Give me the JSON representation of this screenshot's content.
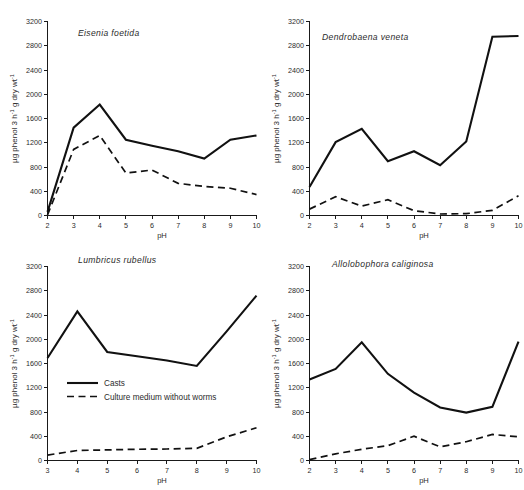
{
  "figure": {
    "name": "phenol-oxidase-activity-vs-ph",
    "axis": {
      "y_label_plain": "µg phenol 3 h-1 g dry wt-1",
      "y_label_parts": {
        "prefix": "µg phenol  3 h",
        "sup1": "-1",
        "mid": "  g dry wt",
        "sup2": "-1"
      },
      "x_label": "pH",
      "y_ticks": [
        0,
        400,
        800,
        1200,
        1600,
        2000,
        2400,
        2800,
        3200
      ],
      "ylim": [
        0,
        3200
      ]
    },
    "legend": {
      "position": "inside-bottom-left-panel-3",
      "items": [
        {
          "label": "Casts",
          "style": "solid"
        },
        {
          "label": "Culture medium without worms",
          "style": "dashed"
        }
      ]
    }
  },
  "chart_data": [
    {
      "id": "eisenia-foetida",
      "type": "line",
      "title": "Eisenia foetida",
      "xlabel": "pH",
      "ylabel": "µg phenol 3 h-1 g dry wt-1",
      "xlim": [
        2,
        10
      ],
      "ylim": [
        0,
        3200
      ],
      "x": [
        2,
        3,
        4,
        5,
        6,
        7,
        8,
        9,
        10
      ],
      "xticks": [
        2,
        3,
        4,
        5,
        6,
        7,
        8,
        9,
        10
      ],
      "grid": false,
      "series": [
        {
          "name": "Casts",
          "style": "solid",
          "values": [
            60,
            1450,
            1830,
            1250,
            1150,
            1060,
            940,
            1250,
            1320
          ]
        },
        {
          "name": "Culture medium without worms",
          "style": "dashed",
          "values": [
            10,
            1090,
            1320,
            700,
            750,
            530,
            480,
            450,
            345
          ]
        }
      ]
    },
    {
      "id": "dendrobaena-veneta",
      "type": "line",
      "title": "Dendrobaena veneta",
      "xlabel": "pH",
      "ylabel": "µg phenol 3 h-1 g dry wt-1",
      "xlim": [
        2,
        10
      ],
      "ylim": [
        0,
        3200
      ],
      "x": [
        2,
        3,
        4,
        5,
        6,
        7,
        8,
        9,
        10
      ],
      "xticks": [
        2,
        3,
        4,
        5,
        6,
        7,
        8,
        9,
        10
      ],
      "grid": false,
      "series": [
        {
          "name": "Casts",
          "style": "solid",
          "values": [
            470,
            1210,
            1430,
            895,
            1060,
            830,
            1220,
            2950,
            2960
          ]
        },
        {
          "name": "Culture medium without worms",
          "style": "dashed",
          "values": [
            105,
            310,
            155,
            260,
            80,
            25,
            30,
            85,
            325
          ]
        }
      ]
    },
    {
      "id": "lumbricus-rubellus",
      "type": "line",
      "title": "Lumbricus rubellus",
      "xlabel": "pH",
      "ylabel": "µg phenol 3 h-1 g dry wt-1",
      "xlim": [
        3,
        10
      ],
      "ylim": [
        0,
        3200
      ],
      "x": [
        3,
        4,
        5,
        6,
        7,
        8,
        9,
        10
      ],
      "xticks": [
        3,
        4,
        5,
        6,
        7,
        8,
        9,
        10
      ],
      "grid": false,
      "series": [
        {
          "name": "Casts",
          "style": "solid",
          "values": [
            1690,
            2460,
            1790,
            1720,
            1650,
            1560,
            2130,
            2720
          ]
        },
        {
          "name": "Culture medium without worms",
          "style": "dashed",
          "values": [
            90,
            165,
            175,
            185,
            190,
            200,
            390,
            540
          ]
        }
      ]
    },
    {
      "id": "allolobophora-caliginosa",
      "type": "line",
      "title": "Allolobophora caliginosa",
      "xlabel": "pH",
      "ylabel": "µg phenol 3 h-1 g dry wt-1",
      "xlim": [
        2,
        10
      ],
      "ylim": [
        0,
        3200
      ],
      "x": [
        2,
        3,
        4,
        5,
        6,
        7,
        8,
        9,
        10
      ],
      "xticks": [
        2,
        3,
        4,
        5,
        6,
        7,
        8,
        9,
        10
      ],
      "grid": false,
      "series": [
        {
          "name": "Casts",
          "style": "solid",
          "values": [
            1335,
            1510,
            1950,
            1430,
            1120,
            875,
            790,
            885,
            1960
          ]
        },
        {
          "name": "Culture medium without worms",
          "style": "dashed",
          "values": [
            15,
            110,
            185,
            245,
            400,
            225,
            310,
            430,
            390
          ]
        }
      ]
    }
  ]
}
